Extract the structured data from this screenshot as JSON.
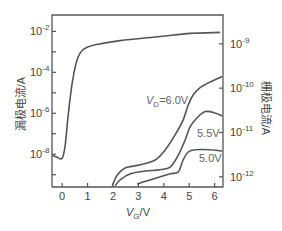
{
  "chart_data": {
    "type": "line",
    "title": "",
    "xlabel": {
      "main": "V",
      "sub": "G",
      "unit": "/V"
    },
    "ylabel_left": "漏极电流/A",
    "ylabel_right": "栅极电流/A",
    "xlim": [
      -0.4,
      6.33
    ],
    "ylim_left_log10": [
      -1.2,
      -9.6
    ],
    "ylim_right_log10": [
      -8.35,
      -12.23
    ],
    "x_ticks": [
      0,
      1,
      2,
      3,
      4,
      5,
      6
    ],
    "x_tick_labels": [
      "0",
      "1",
      "2",
      "3",
      "4",
      "5",
      "6"
    ],
    "y_left_major_ticks": [
      {
        "exp": -2,
        "label_base": "10",
        "label_exp": "-2"
      },
      {
        "exp": -4,
        "label_base": "10",
        "label_exp": "-4"
      },
      {
        "exp": -6,
        "label_base": "10",
        "label_exp": "-6"
      },
      {
        "exp": -8,
        "label_base": "10",
        "label_exp": "-8"
      }
    ],
    "y_left_minor_ticks": [
      -3,
      -5,
      -7,
      -9
    ],
    "y_right_major_ticks": [
      {
        "exp": -9,
        "label_base": "10",
        "label_exp": "-9"
      },
      {
        "exp": -10,
        "label_base": "10",
        "label_exp": "-10"
      },
      {
        "exp": -11,
        "label_base": "10",
        "label_exp": "-11"
      },
      {
        "exp": -12,
        "label_base": "10",
        "label_exp": "-12"
      }
    ],
    "grid": false,
    "series": [
      {
        "name": "drain-current",
        "axis": "left",
        "x": [
          -0.39,
          -0.2,
          0,
          0.12,
          0.24,
          0.39,
          0.55,
          0.71,
          0.94,
          1.3,
          2.28,
          3.86,
          5.04,
          6.22
        ],
        "log10_y": [
          -8.05,
          -8.15,
          -8.2,
          -7.55,
          -6.05,
          -4.55,
          -3.55,
          -3.05,
          -2.8,
          -2.65,
          -2.45,
          -2.25,
          -2.1,
          -2.05
        ]
      },
      {
        "name": "gate-current-VD-6.0V",
        "axis": "right",
        "label": {
          "prefix": "V",
          "sub": "D",
          "suffix": "=6.0V"
        },
        "x": [
          1.97,
          2.17,
          2.48,
          3.07,
          3.66,
          4.06,
          4.45,
          4.76,
          4.96,
          5.16,
          5.43,
          5.83,
          6.3
        ],
        "log10_y": [
          -12.2,
          -11.96,
          -11.8,
          -11.73,
          -11.62,
          -11.39,
          -11.05,
          -10.72,
          -10.38,
          -10.15,
          -9.99,
          -9.86,
          -9.74
        ]
      },
      {
        "name": "gate-current-VD-5.5V",
        "axis": "right",
        "label": {
          "prefix": "",
          "sub": "",
          "suffix": "5.5V"
        },
        "x": [
          2.09,
          2.28,
          2.68,
          3.27,
          3.86,
          4.25,
          4.57,
          4.84,
          5.04,
          5.31,
          5.63,
          6.02,
          6.3
        ],
        "log10_y": [
          -12.2,
          -12.07,
          -11.93,
          -11.87,
          -11.84,
          -11.78,
          -11.51,
          -11.17,
          -10.87,
          -10.67,
          -10.53,
          -10.56,
          -10.63
        ]
      },
      {
        "name": "gate-current-VD-5.0V",
        "axis": "right",
        "label": {
          "prefix": "",
          "sub": "",
          "suffix": "5.0V"
        },
        "x": [
          2.95,
          3.46,
          3.86,
          4.25,
          4.57,
          4.76,
          4.96,
          5.24,
          5.83,
          6.3
        ],
        "log10_y": [
          -12.16,
          -12.07,
          -12.0,
          -11.93,
          -11.89,
          -11.62,
          -11.44,
          -11.39,
          -11.39,
          -11.42
        ]
      }
    ]
  }
}
